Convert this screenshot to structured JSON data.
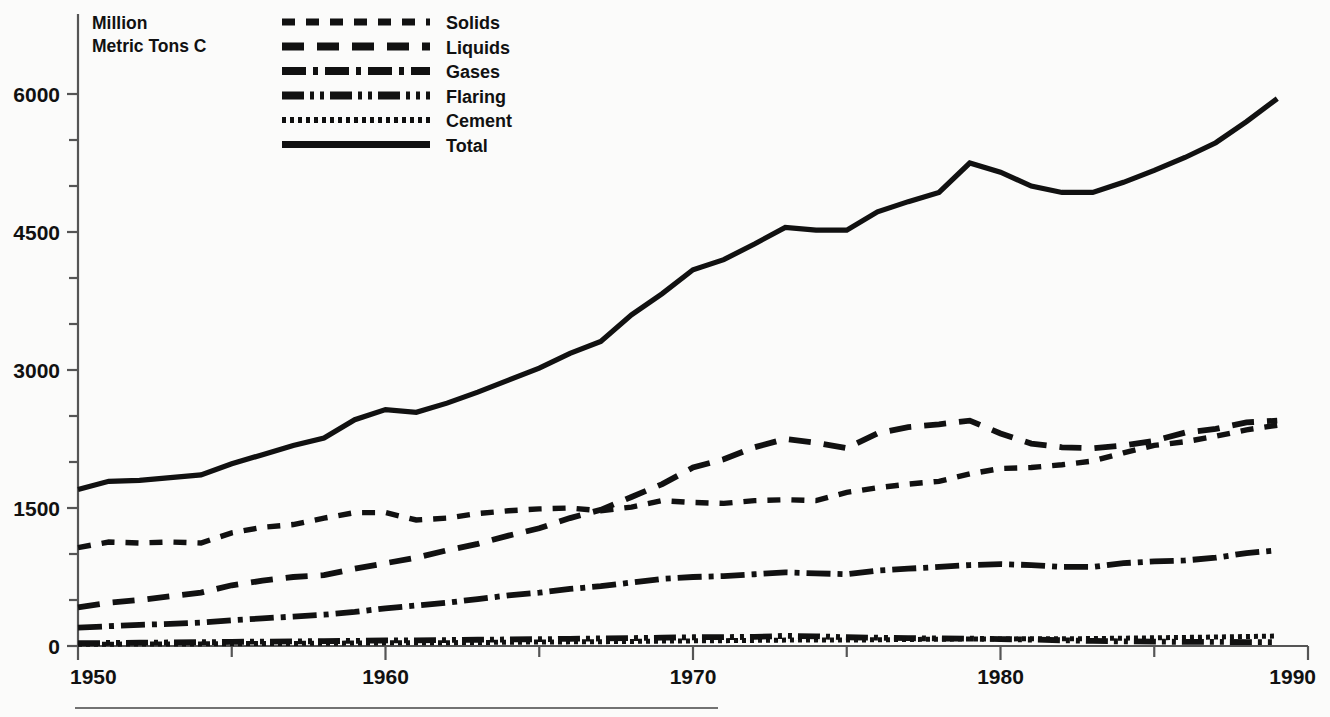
{
  "chart_data": {
    "type": "line",
    "title": "",
    "subtitle": "",
    "ylabel": "Million Metric Tons C",
    "ylabel_line1": "Million",
    "ylabel_line2": "Metric Tons C",
    "xlabel": "",
    "xlim": [
      1950,
      1990
    ],
    "ylim": [
      0,
      6300
    ],
    "grid": false,
    "legend_position": "top-center",
    "y_ticks_major": [
      0,
      1500,
      3000,
      4500,
      6000
    ],
    "y_tick_labels": [
      "0",
      "1500",
      "3000",
      "4500",
      "6000"
    ],
    "y_ticks_minor": [
      500,
      1000,
      2000,
      2500,
      3500,
      4000,
      5000,
      5500
    ],
    "x_ticks_major": [
      1950,
      1960,
      1970,
      1980,
      1990
    ],
    "x_tick_labels": [
      "1950",
      "1960",
      "1970",
      "1980",
      "1990"
    ],
    "x_ticks_minor": [
      1955,
      1965,
      1975,
      1985
    ],
    "x": [
      1950,
      1951,
      1952,
      1953,
      1954,
      1955,
      1956,
      1957,
      1958,
      1959,
      1960,
      1961,
      1962,
      1963,
      1964,
      1965,
      1966,
      1967,
      1968,
      1969,
      1970,
      1971,
      1972,
      1973,
      1974,
      1975,
      1976,
      1977,
      1978,
      1979,
      1980,
      1981,
      1982,
      1983,
      1984,
      1985,
      1986,
      1987,
      1988,
      1989
    ],
    "series": [
      {
        "name": "Solids",
        "style": "dotted-dash",
        "values": [
          1070,
          1130,
          1120,
          1130,
          1120,
          1230,
          1290,
          1320,
          1390,
          1450,
          1450,
          1370,
          1390,
          1440,
          1470,
          1490,
          1500,
          1470,
          1510,
          1580,
          1560,
          1550,
          1580,
          1590,
          1580,
          1670,
          1720,
          1760,
          1790,
          1870,
          1930,
          1940,
          1970,
          2010,
          2100,
          2180,
          2220,
          2280,
          2350,
          2400
        ],
        "dasharray": "13,11"
      },
      {
        "name": "Liquids",
        "style": "dashed",
        "values": [
          420,
          470,
          500,
          540,
          580,
          660,
          710,
          750,
          770,
          840,
          900,
          960,
          1040,
          1110,
          1200,
          1280,
          1390,
          1480,
          1620,
          1760,
          1940,
          2030,
          2160,
          2250,
          2210,
          2150,
          2310,
          2380,
          2410,
          2450,
          2310,
          2200,
          2160,
          2150,
          2180,
          2230,
          2320,
          2360,
          2430,
          2450
        ],
        "dasharray": "22,13"
      },
      {
        "name": "Gases",
        "style": "dash-dot",
        "values": [
          200,
          215,
          230,
          240,
          255,
          280,
          300,
          320,
          340,
          370,
          410,
          440,
          470,
          510,
          550,
          580,
          620,
          650,
          690,
          730,
          750,
          760,
          780,
          800,
          790,
          780,
          820,
          840,
          860,
          880,
          890,
          880,
          860,
          860,
          900,
          920,
          930,
          960,
          1010,
          1040
        ],
        "dasharray": "24,7,5,7"
      },
      {
        "name": "Flaring",
        "style": "dash-dot-dot",
        "values": [
          30,
          33,
          36,
          38,
          41,
          45,
          48,
          50,
          53,
          56,
          60,
          62,
          65,
          68,
          71,
          74,
          78,
          82,
          86,
          90,
          95,
          97,
          99,
          110,
          105,
          95,
          90,
          85,
          82,
          80,
          75,
          70,
          62,
          55,
          50,
          48,
          45,
          44,
          43,
          42
        ],
        "dasharray": "22,6,4,6,4,6"
      },
      {
        "name": "Cement",
        "style": "fine-dotted",
        "values": [
          18,
          20,
          21,
          22,
          23,
          25,
          27,
          28,
          30,
          32,
          34,
          35,
          36,
          38,
          41,
          43,
          45,
          47,
          50,
          53,
          56,
          58,
          61,
          64,
          65,
          64,
          68,
          71,
          74,
          76,
          77,
          78,
          78,
          81,
          85,
          89,
          93,
          98,
          103,
          108
        ],
        "dasharray": "4,4"
      },
      {
        "name": "Total",
        "style": "solid",
        "values": [
          1700,
          1790,
          1800,
          1830,
          1860,
          1980,
          2080,
          2180,
          2260,
          2460,
          2570,
          2540,
          2640,
          2760,
          2890,
          3020,
          3180,
          3310,
          3600,
          3830,
          4090,
          4200,
          4370,
          4550,
          4520,
          4520,
          4720,
          4830,
          4930,
          5250,
          5150,
          5000,
          4930,
          4930,
          5040,
          5170,
          5310,
          5470,
          5700,
          5950
        ]
      }
    ],
    "legend_entries": [
      {
        "label": "Solids",
        "dasharray": "13,11",
        "width": 7
      },
      {
        "label": "Liquids",
        "dasharray": "22,13",
        "width": 8
      },
      {
        "label": "Gases",
        "dasharray": "24,7,5,7",
        "width": 8
      },
      {
        "label": "Flaring",
        "dasharray": "22,6,4,6,4,6",
        "width": 8
      },
      {
        "label": "Cement",
        "dasharray": "4,4",
        "width": 6
      },
      {
        "label": "Total",
        "dasharray": "none",
        "width": 7
      }
    ],
    "colors": {
      "line": "#111111",
      "axis": "#555555",
      "background": "#fbfbfa",
      "text": "#111111"
    }
  }
}
